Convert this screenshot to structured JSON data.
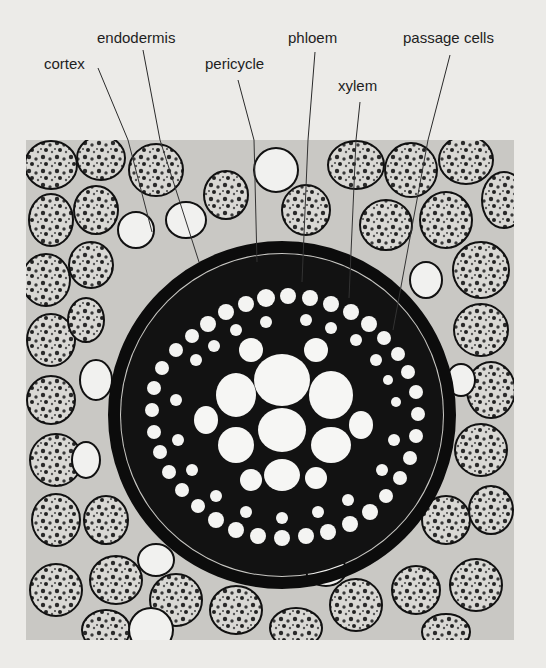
{
  "figure": {
    "type": "light micrograph",
    "background_color": "#ecebe8",
    "micrograph_tone": "grayscale"
  },
  "labels": [
    {
      "id": "cortex",
      "text": "cortex",
      "x": 44,
      "y": 62,
      "line_from": [
        98,
        68
      ],
      "line_to": [
        152,
        232
      ]
    },
    {
      "id": "endodermis",
      "text": "endodermis",
      "x": 97,
      "y": 35,
      "line_from": [
        143,
        50
      ],
      "line_to": [
        199,
        262
      ]
    },
    {
      "id": "pericycle",
      "text": "pericycle",
      "x": 205,
      "y": 62,
      "line_from": [
        238,
        80
      ],
      "line_to": [
        257,
        262
      ]
    },
    {
      "id": "phloem",
      "text": "phloem",
      "x": 288,
      "y": 35,
      "line_from": [
        315,
        52
      ],
      "line_to": [
        302,
        282
      ]
    },
    {
      "id": "xylem",
      "text": "xylem",
      "x": 338,
      "y": 83,
      "line_from": [
        360,
        102
      ],
      "line_to": [
        349,
        298
      ]
    },
    {
      "id": "passage_cells",
      "text": "passage cells",
      "x": 403,
      "y": 35,
      "line_from": [
        450,
        55
      ],
      "line_to": [
        393,
        330
      ]
    }
  ]
}
